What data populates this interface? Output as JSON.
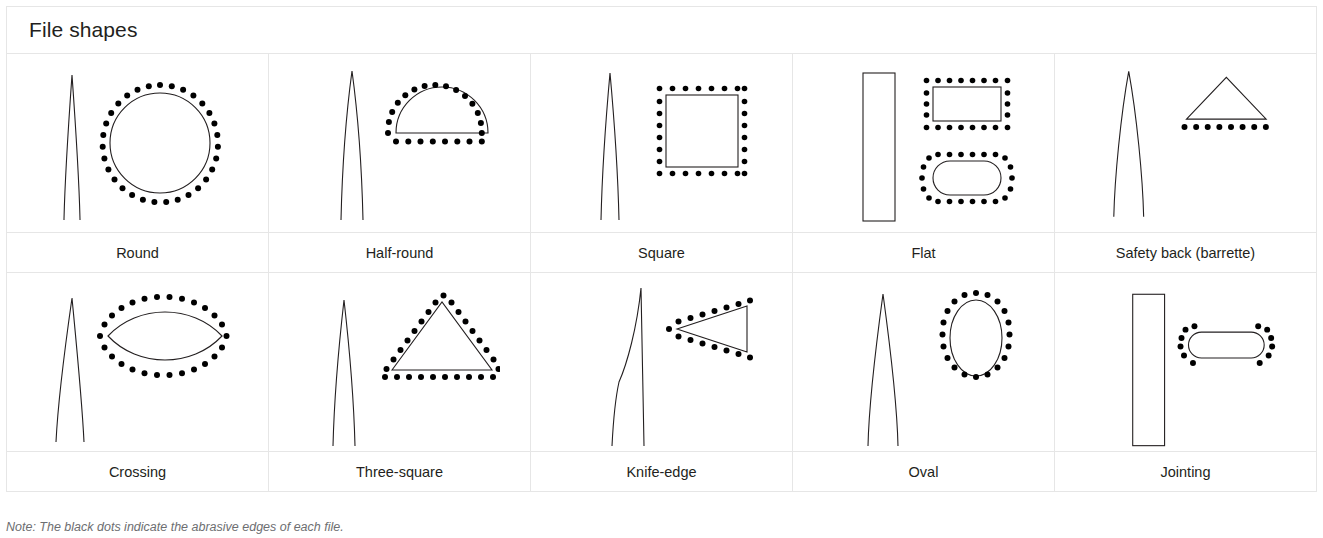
{
  "figure": {
    "title": "File shapes",
    "note": "Note: The black dots indicate the abrasive edges of each file.",
    "colors": {
      "border": "#e6e6e6",
      "stroke": "#231f20",
      "dot": "#000000",
      "text": "#231f20",
      "note_text": "#6d6e71",
      "background": "#ffffff"
    }
  },
  "grid": {
    "columns": 5,
    "rows": 2
  },
  "cells": [
    {
      "label": "Round",
      "profile": "tapered-point",
      "cross_section": "circle",
      "abrasive_edges": "all-around",
      "extra_cross_section": null
    },
    {
      "label": "Half-round",
      "profile": "tapered-point",
      "cross_section": "semicircle",
      "abrasive_edges": "all-around",
      "extra_cross_section": null
    },
    {
      "label": "Square",
      "profile": "tapered-point",
      "cross_section": "square",
      "abrasive_edges": "all-around",
      "extra_cross_section": null
    },
    {
      "label": "Flat",
      "profile": "parallel",
      "cross_section": "rectangle",
      "abrasive_edges": "all-around",
      "extra_cross_section": "rounded-rectangle"
    },
    {
      "label": "Safety back (barrette)",
      "profile": "tapered-point",
      "cross_section": "flat-triangle",
      "abrasive_edges": "bottom-only",
      "extra_cross_section": null
    },
    {
      "label": "Crossing",
      "profile": "tapered-point",
      "cross_section": "lens",
      "abrasive_edges": "all-around",
      "extra_cross_section": null
    },
    {
      "label": "Three-square",
      "profile": "tapered-point",
      "cross_section": "triangle",
      "abrasive_edges": "all-around",
      "extra_cross_section": null
    },
    {
      "label": "Knife-edge",
      "profile": "knife-taper",
      "cross_section": "wedge",
      "abrasive_edges": "two-long-sides",
      "extra_cross_section": null
    },
    {
      "label": "Oval",
      "profile": "tapered-point",
      "cross_section": "ellipse",
      "abrasive_edges": "all-around",
      "extra_cross_section": null
    },
    {
      "label": "Jointing",
      "profile": "parallel",
      "cross_section": "stadium",
      "abrasive_edges": "rounded-ends-only",
      "extra_cross_section": null
    }
  ]
}
